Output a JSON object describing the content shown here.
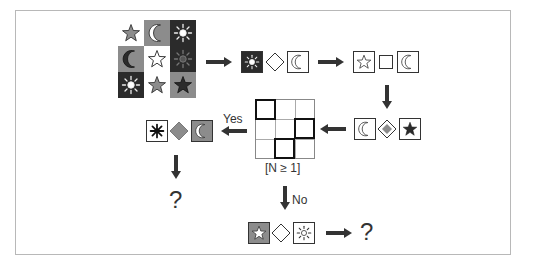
{
  "diagram": {
    "type": "flowchart",
    "colors": {
      "dark": "#2b2b2b",
      "mid": "#8c8c8c",
      "light": "#ffffff",
      "arrow": "#333333",
      "frame": "#b8b8b8"
    },
    "source_grid": {
      "rows": [
        [
          {
            "symbol": "star",
            "bg": "light",
            "fill": "mid"
          },
          {
            "symbol": "moon",
            "bg": "mid",
            "fill": "light"
          },
          {
            "symbol": "sun",
            "bg": "dark",
            "fill": "light"
          }
        ],
        [
          {
            "symbol": "moon",
            "bg": "mid",
            "fill": "dark"
          },
          {
            "symbol": "star",
            "bg": "light",
            "fill": "light"
          },
          {
            "symbol": "sun",
            "bg": "dark",
            "fill": "dark"
          }
        ],
        [
          {
            "symbol": "sun",
            "bg": "dark",
            "fill": "light"
          },
          {
            "symbol": "star",
            "bg": "light",
            "fill": "mid"
          },
          {
            "symbol": "star",
            "bg": "mid",
            "fill": "dark"
          }
        ]
      ]
    },
    "step1": {
      "items": [
        "sun on dark",
        "diamond outline",
        "moon outline"
      ]
    },
    "step2": {
      "items": [
        "star outline",
        "square outline",
        "moon outline"
      ]
    },
    "step3": {
      "items": [
        "moon outline",
        "diamond gray",
        "star filled dark"
      ]
    },
    "condition": {
      "label": "[N ≥ 1]",
      "yes_label": "Yes",
      "no_label": "No"
    },
    "yes_branch": {
      "items": [
        "asterisk dark",
        "diamond gray",
        "moon on gray"
      ],
      "result": "?"
    },
    "no_branch": {
      "items": [
        "star on gray",
        "diamond outline",
        "sun outline"
      ],
      "result": "?"
    }
  }
}
